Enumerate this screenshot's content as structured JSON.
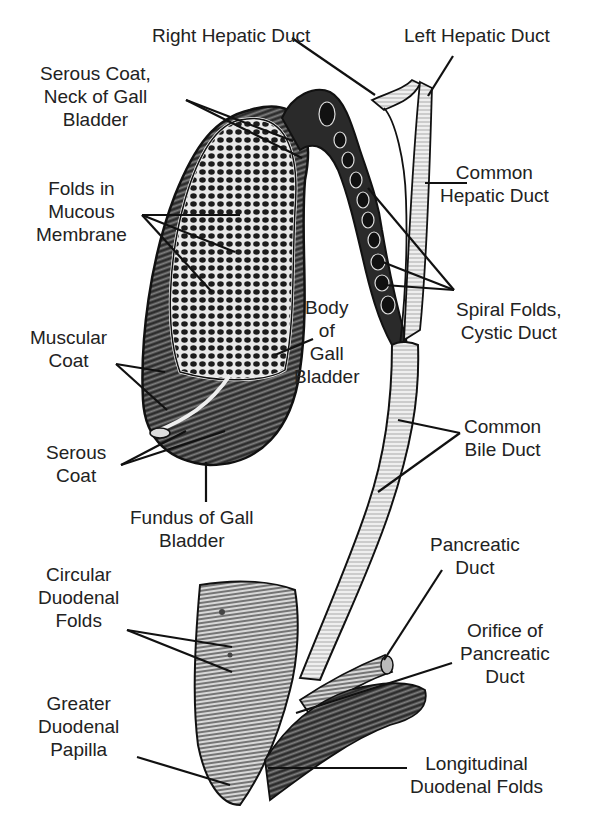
{
  "diagram": {
    "labels": [
      {
        "id": "right-hepatic-duct",
        "lines": [
          "Right Hepatic Duct"
        ]
      },
      {
        "id": "left-hepatic-duct",
        "lines": [
          "Left Hepatic Duct"
        ]
      },
      {
        "id": "serous-coat-neck",
        "lines": [
          "Serous Coat,",
          "Neck of Gall",
          "Bladder"
        ]
      },
      {
        "id": "common-hepatic-duct",
        "lines": [
          "Common",
          "Hepatic Duct"
        ]
      },
      {
        "id": "folds-mucous-membrane",
        "lines": [
          "Folds in",
          "Mucous",
          "Membrane"
        ]
      },
      {
        "id": "body-of-gall-bladder",
        "lines": [
          "Body",
          "of",
          "Gall",
          "Bladder"
        ]
      },
      {
        "id": "spiral-folds-cystic-duct",
        "lines": [
          "Spiral Folds,",
          "Cystic Duct"
        ]
      },
      {
        "id": "muscular-coat",
        "lines": [
          "Muscular",
          "Coat"
        ]
      },
      {
        "id": "common-bile-duct",
        "lines": [
          "Common",
          "Bile Duct"
        ]
      },
      {
        "id": "serous-coat",
        "lines": [
          "Serous",
          "Coat"
        ]
      },
      {
        "id": "fundus-of-gall-bladder",
        "lines": [
          "Fundus of Gall",
          "Bladder"
        ]
      },
      {
        "id": "pancreatic-duct",
        "lines": [
          "Pancreatic",
          "Duct"
        ]
      },
      {
        "id": "circular-duodenal-folds",
        "lines": [
          "Circular",
          "Duodenal",
          "Folds"
        ]
      },
      {
        "id": "orifice-of-pancreatic-duct",
        "lines": [
          "Orifice of",
          "Pancreatic",
          "Duct"
        ]
      },
      {
        "id": "greater-duodenal-papilla",
        "lines": [
          "Greater",
          "Duodenal",
          "Papilla"
        ]
      },
      {
        "id": "longitudinal-duodenal-folds",
        "lines": [
          "Longitudinal",
          "Duodenal Folds"
        ]
      }
    ]
  }
}
